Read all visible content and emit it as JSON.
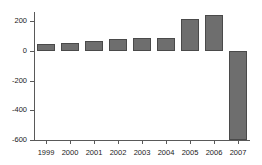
{
  "chart_data": {
    "type": "bar",
    "title": "",
    "subtitle": "",
    "xlabel": "",
    "ylabel": "",
    "categories": [
      "1999",
      "2000",
      "2001",
      "2002",
      "2003",
      "2004",
      "2005",
      "2006",
      "2007"
    ],
    "values": [
      45,
      55,
      70,
      80,
      85,
      90,
      215,
      240,
      -600
    ],
    "series": [
      {
        "name": "",
        "values": [
          45,
          55,
          70,
          80,
          85,
          90,
          215,
          240,
          -600
        ]
      }
    ],
    "ylim": [
      -600,
      300
    ],
    "xlim": [
      0,
      9
    ],
    "y_ticks": [
      200,
      0,
      -200,
      -400,
      -600
    ],
    "y_tick_labels": [
      "200",
      "0",
      "-200",
      "-400",
      "-600"
    ],
    "x_tick_labels": [
      "1999",
      "2000",
      "2001",
      "2002",
      "2003",
      "2004",
      "2005",
      "2006",
      "2007"
    ],
    "grid": false,
    "legend": null,
    "legend_position": "none",
    "bar_color": "#6e6e6e",
    "bar_edge_color": "#4a4a4a",
    "axis_color": "#595959",
    "text_color": "#1a1a1a",
    "background_color": "#ffffff",
    "annotations": []
  }
}
